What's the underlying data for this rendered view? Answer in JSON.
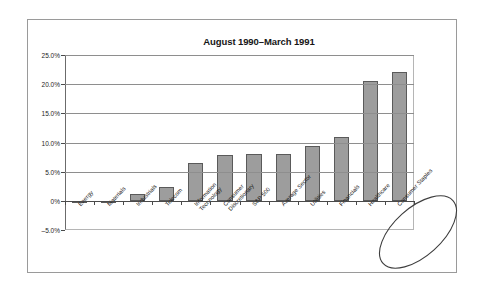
{
  "chart_data": {
    "type": "bar",
    "title": "August 1990–March 1991",
    "xlabel": "",
    "ylabel": "",
    "ylim": [
      -5.0,
      25.0
    ],
    "ytick_labels": [
      "25.0%",
      "20.0%",
      "15.0%",
      "10.0%",
      "5.0%",
      "0%",
      "–5.0%"
    ],
    "ytick_values": [
      25.0,
      20.0,
      15.0,
      10.0,
      5.0,
      0.0,
      -5.0
    ],
    "grid": true,
    "legend": null,
    "bar_color": "#9d9d9d",
    "bar_edge_color": "#5a5a5a",
    "categories": [
      "Energy",
      "Materials",
      "Industrials",
      "Telecom",
      "Information Technology",
      "Consumer Discretionary",
      "S&P 500",
      "Average Sector",
      "Utilities",
      "Financials",
      "Healthcare",
      "Consumer Staples"
    ],
    "category_lines": [
      [
        "Energy"
      ],
      [
        "Materials"
      ],
      [
        "Industrials"
      ],
      [
        "Telecom"
      ],
      [
        "Information",
        "Technology"
      ],
      [
        "Consumer",
        "Discretionary"
      ],
      [
        "S&P 500"
      ],
      [
        "Average Sector"
      ],
      [
        "Utilities"
      ],
      [
        "Financials"
      ],
      [
        "Healthcare"
      ],
      [
        "Consumer Staples"
      ]
    ],
    "values": [
      -0.4,
      -0.3,
      1.2,
      2.3,
      6.5,
      7.8,
      8.1,
      8.1,
      9.4,
      11.0,
      20.5,
      22.1
    ],
    "annotations": [
      {
        "type": "ellipse",
        "name": "highlight-ellipse",
        "encircles": [
          "Healthcare",
          "Consumer Staples"
        ]
      }
    ]
  }
}
